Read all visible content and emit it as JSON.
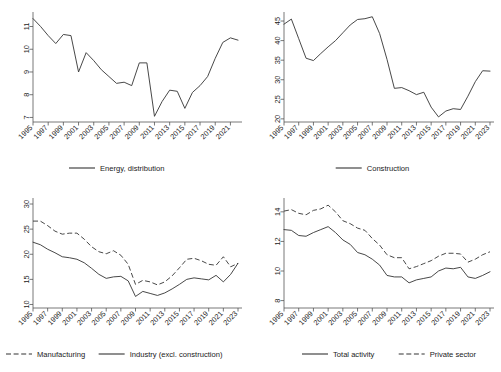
{
  "figure": {
    "name": "four-panel-time-series-figure",
    "background": "#ffffff",
    "line_color": "#333333",
    "axis_color": "#555555"
  },
  "chart_data": [
    {
      "id": "energy-distribution",
      "type": "line",
      "title": "",
      "xlabel": "",
      "ylabel": "",
      "grid": false,
      "legend_position": "bottom",
      "xlim": [
        1995,
        2022
      ],
      "ylim": [
        6.8,
        11.55
      ],
      "yticks": [
        7,
        8,
        9,
        10,
        11
      ],
      "xticks": [
        1995,
        1997,
        1999,
        2001,
        2003,
        2005,
        2007,
        2009,
        2011,
        2013,
        2015,
        2017,
        2019,
        2021
      ],
      "x": [
        1995,
        1996,
        1997,
        1998,
        1999,
        2000,
        2001,
        2002,
        2003,
        2004,
        2005,
        2006,
        2007,
        2008,
        2009,
        2010,
        2011,
        2012,
        2013,
        2014,
        2015,
        2016,
        2017,
        2018,
        2019,
        2020,
        2021,
        2022
      ],
      "series": [
        {
          "name": "Energy, distribution",
          "style": "solid",
          "values": [
            11.35,
            11.0,
            10.6,
            10.25,
            10.65,
            10.6,
            9.0,
            9.85,
            9.5,
            9.1,
            8.8,
            8.5,
            8.55,
            8.4,
            9.4,
            9.4,
            7.05,
            7.7,
            8.2,
            8.15,
            7.4,
            8.1,
            8.4,
            8.8,
            9.6,
            10.3,
            10.5,
            10.4
          ]
        }
      ]
    },
    {
      "id": "construction",
      "type": "line",
      "title": "",
      "xlabel": "",
      "ylabel": "",
      "grid": false,
      "legend_position": "bottom",
      "xlim": [
        1995,
        2023
      ],
      "ylim": [
        19.2,
        46.8
      ],
      "yticks": [
        20,
        25,
        30,
        35,
        40,
        45
      ],
      "xticks": [
        1995,
        1997,
        1999,
        2001,
        2003,
        2005,
        2007,
        2009,
        2011,
        2013,
        2015,
        2017,
        2019,
        2021,
        2023
      ],
      "x": [
        1995,
        1996,
        1997,
        1998,
        1999,
        2000,
        2001,
        2002,
        2003,
        2004,
        2005,
        2006,
        2007,
        2008,
        2009,
        2010,
        2011,
        2012,
        2013,
        2014,
        2015,
        2016,
        2017,
        2018,
        2019,
        2020,
        2021,
        2022,
        2023
      ],
      "series": [
        {
          "name": "Construction",
          "style": "solid",
          "values": [
            44.2,
            45.5,
            40.5,
            35.5,
            34.9,
            36.7,
            38.4,
            40.0,
            42.0,
            44.0,
            45.4,
            45.6,
            46.1,
            41.8,
            35.2,
            27.8,
            28.0,
            27.2,
            26.2,
            26.8,
            23.0,
            20.5,
            22.0,
            22.6,
            22.4,
            25.8,
            29.5,
            32.3,
            32.2
          ]
        }
      ]
    },
    {
      "id": "manufacturing-industry",
      "type": "line",
      "title": "",
      "xlabel": "",
      "ylabel": "",
      "grid": false,
      "legend_position": "bottom",
      "xlim": [
        1995,
        2023
      ],
      "ylim": [
        9.3,
        30.8
      ],
      "yticks": [
        10,
        15,
        20,
        25,
        30
      ],
      "xticks": [
        1995,
        1997,
        1999,
        2001,
        2003,
        2005,
        2007,
        2009,
        2011,
        2013,
        2015,
        2017,
        2019,
        2021,
        2023
      ],
      "x": [
        1995,
        1996,
        1997,
        1998,
        1999,
        2000,
        2001,
        2002,
        2003,
        2004,
        2005,
        2006,
        2007,
        2008,
        2009,
        2010,
        2011,
        2012,
        2013,
        2014,
        2015,
        2016,
        2017,
        2018,
        2019,
        2020,
        2021,
        2022,
        2023
      ],
      "series": [
        {
          "name": "Manufacturing",
          "style": "dashed",
          "values": [
            26.6,
            26.6,
            25.7,
            24.6,
            24.0,
            24.2,
            24.2,
            23.0,
            21.5,
            20.5,
            20.1,
            20.7,
            19.8,
            18.0,
            14.0,
            14.8,
            14.5,
            13.9,
            14.5,
            15.7,
            17.3,
            19.0,
            19.2,
            18.7,
            18.0,
            17.8,
            19.5,
            17.5,
            18.2
          ]
        },
        {
          "name": "Industry (excl. construction)",
          "style": "solid",
          "values": [
            22.4,
            21.9,
            21.0,
            20.3,
            19.5,
            19.3,
            19.0,
            18.3,
            17.2,
            16.0,
            15.2,
            15.5,
            15.6,
            14.7,
            11.6,
            12.6,
            12.2,
            11.8,
            12.3,
            13.1,
            14.0,
            15.0,
            15.3,
            15.1,
            14.9,
            15.8,
            14.5,
            16.0,
            18.2
          ]
        }
      ]
    },
    {
      "id": "total-activity-private-sector",
      "type": "line",
      "title": "",
      "xlabel": "",
      "ylabel": "",
      "grid": false,
      "legend_position": "bottom",
      "xlim": [
        1995,
        2023
      ],
      "ylim": [
        7.5,
        14.8
      ],
      "yticks": [
        8,
        10,
        12,
        14
      ],
      "xticks": [
        1995,
        1997,
        1999,
        2001,
        2003,
        2005,
        2007,
        2009,
        2011,
        2013,
        2015,
        2017,
        2019,
        2021,
        2023
      ],
      "x": [
        1995,
        1996,
        1997,
        1998,
        1999,
        2000,
        2001,
        2002,
        2003,
        2004,
        2005,
        2006,
        2007,
        2008,
        2009,
        2010,
        2011,
        2012,
        2013,
        2014,
        2015,
        2016,
        2017,
        2018,
        2019,
        2020,
        2021,
        2022,
        2023
      ],
      "series": [
        {
          "name": "Total activity",
          "style": "solid",
          "values": [
            12.8,
            12.75,
            12.4,
            12.35,
            12.6,
            12.8,
            13.0,
            12.6,
            12.1,
            11.8,
            11.25,
            11.1,
            10.8,
            10.4,
            9.7,
            9.6,
            9.6,
            9.2,
            9.4,
            9.5,
            9.6,
            10.0,
            10.2,
            10.15,
            10.25,
            9.6,
            9.5,
            9.7,
            9.95
          ]
        },
        {
          "name": "Private sector",
          "style": "dashed",
          "values": [
            14.05,
            14.15,
            13.9,
            13.8,
            14.1,
            14.2,
            14.45,
            14.0,
            13.4,
            13.2,
            12.9,
            12.75,
            12.2,
            11.75,
            11.1,
            10.9,
            10.9,
            10.15,
            10.3,
            10.5,
            10.7,
            11.0,
            11.2,
            11.2,
            11.15,
            10.6,
            10.8,
            11.1,
            11.3
          ]
        }
      ]
    }
  ],
  "panels": [
    {
      "id": "panel-energy-distribution",
      "legend": [
        {
          "label": "Energy, distribution",
          "style": "solid"
        }
      ]
    },
    {
      "id": "panel-construction",
      "legend": [
        {
          "label": "Construction",
          "style": "solid"
        }
      ]
    },
    {
      "id": "panel-manufacturing-industry",
      "legend": [
        {
          "label": "Manufacturing",
          "style": "dashed"
        },
        {
          "label": "Industry (excl. construction)",
          "style": "solid"
        }
      ]
    },
    {
      "id": "panel-total-activity",
      "legend": [
        {
          "label": "Total activity",
          "style": "solid"
        },
        {
          "label": "Private sector",
          "style": "dashed"
        }
      ]
    }
  ]
}
